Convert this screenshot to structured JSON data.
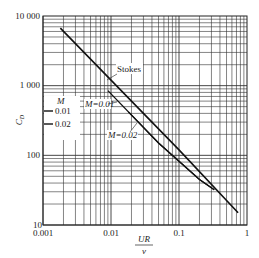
{
  "chart_data": {
    "type": "line",
    "title": "",
    "xlabel": "UR/ν",
    "xlabel_num": "UR",
    "xlabel_den": "ν",
    "ylabel": "C_D",
    "xscale": "log",
    "yscale": "log",
    "xlim": [
      0.001,
      1
    ],
    "ylim": [
      10,
      10000
    ],
    "grid": true,
    "x_ticks": [
      "0.001",
      "0.01",
      "0.1",
      "1"
    ],
    "y_ticks": [
      "10",
      "100",
      "1 000",
      "10 000"
    ],
    "series": [
      {
        "name": "Stokes",
        "x": [
          0.0018,
          0.01,
          0.1,
          0.74
        ],
        "y": [
          6700,
          1200,
          120,
          15
        ]
      },
      {
        "name": "M=0.01",
        "x": [
          0.009,
          0.05,
          0.2,
          0.33
        ],
        "y": [
          850,
          150,
          45,
          32
        ]
      },
      {
        "name": "M=0.02",
        "x": [
          0.018,
          0.05,
          0.2,
          0.33
        ],
        "y": [
          420,
          150,
          45,
          32
        ]
      }
    ],
    "annotations": [
      "Stokes",
      "M=0.01",
      "M=0.02",
      "M",
      "0.01",
      "0.02"
    ],
    "legend": {
      "title": "M",
      "entries": [
        "0.01",
        "0.02"
      ],
      "position": "left-inside"
    }
  }
}
